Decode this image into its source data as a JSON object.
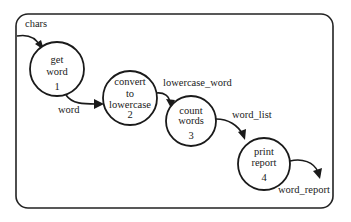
{
  "diagram": {
    "type": "data-flow-diagram",
    "processes": [
      {
        "id": 1,
        "lines": [
          "get",
          "word"
        ],
        "number": "1"
      },
      {
        "id": 2,
        "lines": [
          "convert",
          "to",
          "lowercase"
        ],
        "number": "2"
      },
      {
        "id": 3,
        "lines": [
          "count",
          "words"
        ],
        "number": "3"
      },
      {
        "id": 4,
        "lines": [
          "print",
          "report"
        ],
        "number": "4"
      }
    ],
    "flows": [
      {
        "label": "chars",
        "from": "external",
        "to": 1
      },
      {
        "label": "word",
        "from": 1,
        "to": 2
      },
      {
        "label": "lowercase_word",
        "from": 2,
        "to": 3
      },
      {
        "label": "word_list",
        "from": 3,
        "to": 4
      },
      {
        "label": "word_report",
        "from": 4,
        "to": "external"
      }
    ]
  }
}
